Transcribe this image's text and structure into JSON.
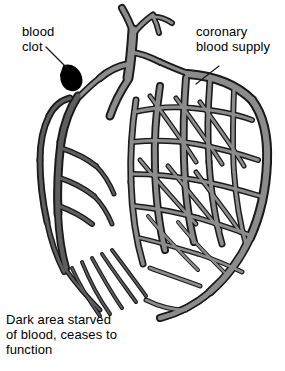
{
  "diagram": {
    "background_color": "#ffffff"
  },
  "labels": {
    "clot": "blood\nclot",
    "coronary": "coronary\nblood supply",
    "dark_area": "Dark area starved\nof blood, ceases to\nfunction"
  },
  "colors": {
    "outline": "#1a1a1a",
    "healthy_vessel": "#8c8c8c",
    "starved_vessel": "#5e5e5e",
    "clot": "#000000",
    "leader_line": "#1a1a1a",
    "text": "#000000"
  },
  "regions": [
    {
      "name": "coronary-blood-supply",
      "fill": "#8c8c8c",
      "state": "perfused"
    },
    {
      "name": "starved-territory",
      "fill": "#5e5e5e",
      "state": "ischaemic"
    },
    {
      "name": "blood-clot",
      "fill": "#000000",
      "state": "occlusion"
    }
  ],
  "leaders": [
    {
      "name": "clot-leader",
      "from": [
        46,
        47
      ],
      "to": [
        69,
        70
      ]
    },
    {
      "name": "coronary-leader",
      "from": [
        219,
        66
      ],
      "to": [
        196,
        84
      ]
    }
  ]
}
